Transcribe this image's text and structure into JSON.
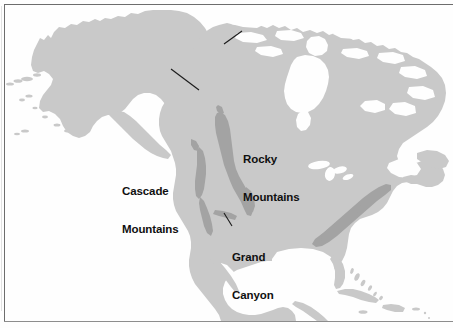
{
  "figure": {
    "name": "north-america-physical-features-map",
    "projection_note": "",
    "frame_color": "#6d6d6d",
    "background_color": "#fefefe"
  },
  "legend_colors": {
    "ocean": "#fefefe",
    "land": "#c9c9c9",
    "mountain_highlight": "#a3a3a3",
    "label_text": "#101010",
    "leader_line": "#1a1a1a"
  },
  "labels": [
    {
      "id": "rocky-mountains",
      "lines": [
        "Rocky",
        "Mountains"
      ],
      "line1": "Rocky",
      "line2": "Mountains",
      "x": 243,
      "y": 128,
      "leader_from": [
        241,
        150
      ],
      "leader_to": [
        224,
        161
      ]
    },
    {
      "id": "cascade-mountains",
      "lines": [
        "Cascade",
        "Mountains"
      ],
      "line1": "Cascade",
      "line2": "Mountains",
      "x": 122,
      "y": 160,
      "leader_from": [
        172,
        167
      ],
      "leader_to": [
        198,
        187
      ]
    },
    {
      "id": "grand-canyon",
      "lines": [
        "Grand",
        "Canyon"
      ],
      "line1": "Grand",
      "line2": "Canyon",
      "x": 232,
      "y": 226,
      "leader_from": [
        231,
        224
      ],
      "leader_to": [
        224,
        211
      ]
    }
  ],
  "mountain_ranges": [
    {
      "name": "Rocky Mountains",
      "shading": "#a3a3a3",
      "orientation": "north-south",
      "region": "western-interior"
    },
    {
      "name": "Cascade Mountains",
      "shading": "#a3a3a3",
      "orientation": "north-south",
      "region": "pacific-coast"
    },
    {
      "name": "Sierra Nevada",
      "shading": "#a3a3a3",
      "orientation": "north-south",
      "region": "pacific-coast-south"
    },
    {
      "name": "Appalachian Mountains",
      "shading": "#a3a3a3",
      "orientation": "southwest-northeast",
      "region": "eastern-us"
    },
    {
      "name": "Grand Canyon",
      "shading": "#a3a3a3",
      "orientation": "east-west",
      "region": "southwest-us"
    }
  ],
  "water_bodies": [
    "Hudson Bay",
    "Gulf of Mexico",
    "Gulf of California",
    "Great Lakes",
    "Pacific Ocean",
    "Atlantic Ocean",
    "Caribbean Sea",
    "Arctic Ocean"
  ],
  "landmasses": [
    "Alaska",
    "Aleutian Islands",
    "Canada",
    "Canadian Arctic Archipelago",
    "United States",
    "Baja California",
    "Mexico",
    "Central America",
    "Cuba",
    "Hispaniola",
    "Bahamas",
    "Newfoundland",
    "Florida"
  ]
}
